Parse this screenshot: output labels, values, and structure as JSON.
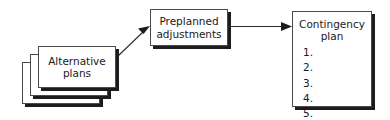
{
  "diagram": {
    "type": "flow-diagram",
    "background_color": "#ffffff",
    "line_color": "#2b2b2b",
    "shadow_color": "#1c1c1c",
    "nodes": [
      {
        "id": "alternative-plans",
        "label_line1": "Alternative",
        "label_line2": "plans",
        "shape": "stacked-rectangle",
        "stack_count": 3
      },
      {
        "id": "preplanned-adjustments",
        "label_line1": "Preplanned",
        "label_line2": "adjustments",
        "shape": "rectangle"
      },
      {
        "id": "contingency-plan",
        "title_line1": "Contingency",
        "title_line2": "plan",
        "shape": "rectangle",
        "steps": [
          "1.",
          "2.",
          "3.",
          "4.",
          "5."
        ]
      }
    ],
    "connectors": [
      {
        "id": "alt-to-preplanned",
        "from": "alternative-plans",
        "to": "preplanned-adjustments",
        "style": "diagonal-arrow"
      },
      {
        "id": "preplanned-to-contingency",
        "from": "preplanned-adjustments",
        "to": "contingency-plan",
        "style": "horizontal-arrow"
      }
    ]
  }
}
